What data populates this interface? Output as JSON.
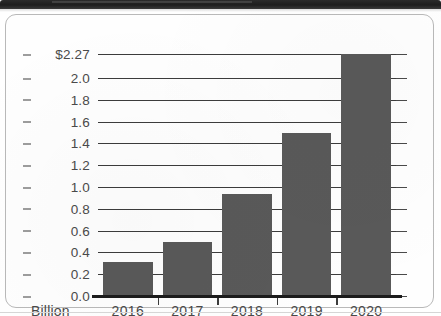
{
  "banner": {
    "name": "page-header-bar",
    "color": "#1d1d1d"
  },
  "card": {
    "border_color": "#b9b9b9",
    "background": "#fefefe"
  },
  "chart_data": {
    "type": "bar",
    "title": "",
    "subtitle": "",
    "xlabel": "",
    "ylabel": "",
    "unit_label": "Billion",
    "categories": [
      "2016",
      "2017",
      "2018",
      "2019",
      "2020"
    ],
    "values": [
      0.31,
      0.5,
      0.94,
      1.5,
      2.27
    ],
    "series": [
      {
        "name": "Annual value",
        "values": [
          0.31,
          0.5,
          0.94,
          1.5,
          2.27
        ]
      }
    ],
    "ylim": [
      0.0,
      2.27
    ],
    "ytick_values": [
      2.27,
      2.0,
      1.8,
      1.6,
      1.4,
      1.2,
      1.0,
      0.8,
      0.6,
      0.4,
      0.2,
      0.0
    ],
    "ytick_labels": [
      "$2.27",
      "2.0",
      "1.8",
      "1.6",
      "1.4",
      "1.2",
      "1.0",
      "0.8",
      "0.6",
      "0.4",
      "0.2",
      "0.0"
    ],
    "grid": true,
    "grid_axis": "y",
    "legend": false,
    "legend_position": "none",
    "bar_color": "#595959",
    "axis_color": "#1c1c1c",
    "tick_label_color": "#4a4a4a",
    "annotations": []
  }
}
